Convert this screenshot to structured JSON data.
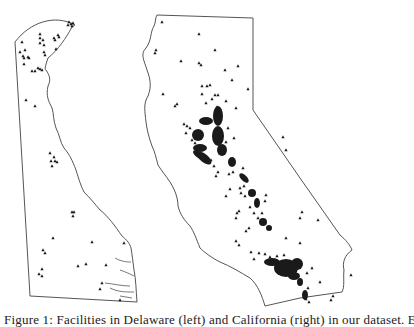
{
  "figure": {
    "panels": [
      {
        "name": "Delaware",
        "position": "left",
        "marker": "triangle"
      },
      {
        "name": "California",
        "position": "right",
        "marker": "triangle"
      }
    ],
    "colors": {
      "outline": "#555555",
      "marker": "#1a1a1a",
      "background": "#ffffff"
    }
  },
  "caption": {
    "text": "Figure 1: Facilities in Delaware (left) and California (right) in our dataset. Each"
  }
}
